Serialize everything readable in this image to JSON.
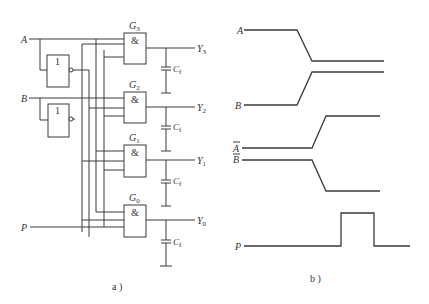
{
  "figure_a": {
    "caption": "a )",
    "inputs": [
      {
        "label": "A",
        "sub": ""
      },
      {
        "label": "B",
        "sub": ""
      },
      {
        "label": "P",
        "sub": ""
      }
    ],
    "inverters": [
      {
        "symbol": "1"
      },
      {
        "symbol": "1"
      }
    ],
    "gates": [
      {
        "name": "G",
        "sub": "3",
        "symbol": "&",
        "output": "Y",
        "output_sub": "3"
      },
      {
        "name": "G",
        "sub": "2",
        "symbol": "&",
        "output": "Y",
        "output_sub": "2"
      },
      {
        "name": "G",
        "sub": "1",
        "symbol": "&",
        "output": "Y",
        "output_sub": "1"
      },
      {
        "name": "G",
        "sub": "0",
        "symbol": "&",
        "output": "Y",
        "output_sub": "0"
      }
    ],
    "capacitor": {
      "label": "C",
      "sub": "f"
    }
  },
  "figure_b": {
    "caption": "b )",
    "signals": [
      {
        "label": "A",
        "overline": false
      },
      {
        "label": "B",
        "overline": false
      },
      {
        "label": "A",
        "overline": true
      },
      {
        "label": "B",
        "overline": true
      },
      {
        "label": "P",
        "overline": false
      }
    ]
  },
  "colors": {
    "line": "#3a3a3a",
    "background": "#ffffff"
  }
}
